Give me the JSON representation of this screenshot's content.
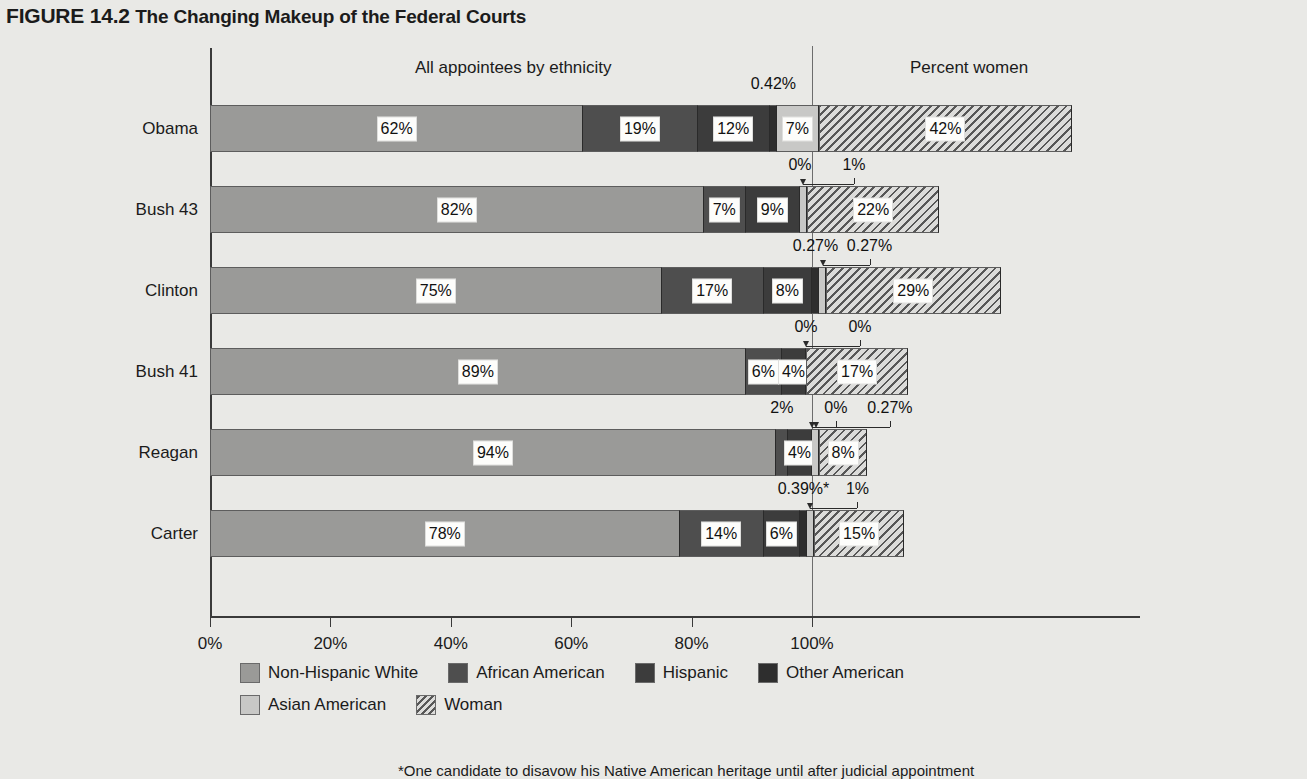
{
  "figure": {
    "number": "FIGURE 14.2",
    "title": "The Changing Makeup of the Federal Courts"
  },
  "headers": {
    "ethnicity": "All appointees by ethnicity",
    "women": "Percent women"
  },
  "footnote": "*One candidate to disavow his Native American heritage until after judicial appointment",
  "legend": {
    "row1": [
      {
        "label": "Non-Hispanic White",
        "key": "white",
        "color": "#9a9a98"
      },
      {
        "label": "African American",
        "key": "africanamerican",
        "color": "#4e4e4e"
      },
      {
        "label": "Hispanic",
        "key": "hispanic",
        "color": "#3c3c3c"
      },
      {
        "label": "Other American",
        "key": "other",
        "color": "#2e2e2e"
      }
    ],
    "row2": [
      {
        "label": "Asian American",
        "key": "asian",
        "color": "#c8c8c6"
      },
      {
        "label": "Woman",
        "key": "woman",
        "color": "#dcdcda"
      }
    ]
  },
  "chart_data": {
    "type": "bar",
    "title": "The Changing Makeup of the Federal Courts",
    "xlabel": "",
    "ylabel": "",
    "xlim": [
      0,
      143
    ],
    "xticks": [
      0,
      20,
      40,
      60,
      80,
      100
    ],
    "xtick_labels": [
      "0%",
      "20%",
      "40%",
      "60%",
      "80%",
      "100%"
    ],
    "grid": false,
    "legend_position": "bottom",
    "orientation": "horizontal",
    "stacked": true,
    "reference_line": 100,
    "categories": [
      "Obama",
      "Bush 43",
      "Clinton",
      "Bush 41",
      "Reagan",
      "Carter"
    ],
    "series": [
      {
        "name": "Non-Hispanic White",
        "key": "white",
        "values": [
          62,
          82,
          75,
          89,
          94,
          78
        ],
        "labels": [
          "62%",
          "82%",
          "75%",
          "89%",
          "94%",
          "78%"
        ]
      },
      {
        "name": "African American",
        "key": "africanamerican",
        "values": [
          19,
          7,
          17,
          6,
          2,
          14
        ],
        "labels": [
          "19%",
          "7%",
          "17%",
          "6%",
          "2%",
          "14%"
        ]
      },
      {
        "name": "Hispanic",
        "key": "hispanic",
        "values": [
          12,
          9,
          8,
          4,
          4,
          6
        ],
        "labels": [
          "12%",
          "9%",
          "8%",
          "4%",
          "4%",
          "6%"
        ]
      },
      {
        "name": "Other American",
        "key": "other",
        "values": [
          0.42,
          0,
          0.27,
          0,
          0,
          0.39
        ],
        "labels": [
          "0.42%",
          "0%",
          "0.27%",
          "0%",
          "0%",
          "0.39%*"
        ]
      },
      {
        "name": "Asian American",
        "key": "asian",
        "values": [
          7,
          1,
          0.27,
          0,
          0.27,
          1
        ],
        "labels": [
          "7%",
          "1%",
          "0.27%",
          "0%",
          "0.27%",
          "1%"
        ]
      },
      {
        "name": "Woman",
        "key": "woman",
        "values": [
          42,
          22,
          29,
          17,
          8,
          15
        ],
        "labels": [
          "42%",
          "22%",
          "29%",
          "17%",
          "8%",
          "15%"
        ]
      }
    ]
  },
  "rows": [
    {
      "label": "Obama",
      "segments": [
        {
          "key": "white",
          "label": "62%",
          "inline": true
        },
        {
          "key": "africanamerican",
          "label": "19%",
          "inline": true
        },
        {
          "key": "hispanic",
          "label": "12%",
          "inline": true
        },
        {
          "key": "other",
          "label": "0.42%",
          "inline": false
        },
        {
          "key": "asian",
          "label": "7%",
          "inline": true
        },
        {
          "key": "woman",
          "label": "42%",
          "inline": true
        }
      ]
    },
    {
      "label": "Bush 43",
      "segments": [
        {
          "key": "white",
          "label": "82%",
          "inline": true
        },
        {
          "key": "africanamerican",
          "label": "7%",
          "inline": true
        },
        {
          "key": "hispanic",
          "label": "9%",
          "inline": true
        },
        {
          "key": "other",
          "label": "0%",
          "inline": false
        },
        {
          "key": "asian",
          "label": "1%",
          "inline": false
        },
        {
          "key": "woman",
          "label": "22%",
          "inline": true
        }
      ]
    },
    {
      "label": "Clinton",
      "segments": [
        {
          "key": "white",
          "label": "75%",
          "inline": true
        },
        {
          "key": "africanamerican",
          "label": "17%",
          "inline": true
        },
        {
          "key": "hispanic",
          "label": "8%",
          "inline": true
        },
        {
          "key": "other",
          "label": "0.27%",
          "inline": false
        },
        {
          "key": "asian",
          "label": "0.27%",
          "inline": false
        },
        {
          "key": "woman",
          "label": "29%",
          "inline": true
        }
      ]
    },
    {
      "label": "Bush 41",
      "segments": [
        {
          "key": "white",
          "label": "89%",
          "inline": true
        },
        {
          "key": "africanamerican",
          "label": "6%",
          "inline": true
        },
        {
          "key": "hispanic",
          "label": "4%",
          "inline": true
        },
        {
          "key": "other",
          "label": "0%",
          "inline": false
        },
        {
          "key": "asian",
          "label": "0%",
          "inline": false
        },
        {
          "key": "woman",
          "label": "17%",
          "inline": true
        }
      ]
    },
    {
      "label": "Reagan",
      "segments": [
        {
          "key": "white",
          "label": "94%",
          "inline": true
        },
        {
          "key": "africanamerican",
          "label": "2%",
          "inline": false
        },
        {
          "key": "hispanic",
          "label": "4%",
          "inline": true
        },
        {
          "key": "other",
          "label": "0%",
          "inline": false
        },
        {
          "key": "asian",
          "label": "0.27%",
          "inline": false
        },
        {
          "key": "woman",
          "label": "8%",
          "inline": true
        }
      ]
    },
    {
      "label": "Carter",
      "segments": [
        {
          "key": "white",
          "label": "78%",
          "inline": true
        },
        {
          "key": "africanamerican",
          "label": "14%",
          "inline": true
        },
        {
          "key": "hispanic",
          "label": "6%",
          "inline": true
        },
        {
          "key": "other",
          "label": "0.39%*",
          "inline": false
        },
        {
          "key": "asian",
          "label": "1%",
          "inline": false
        },
        {
          "key": "woman",
          "label": "15%",
          "inline": true
        }
      ]
    }
  ]
}
